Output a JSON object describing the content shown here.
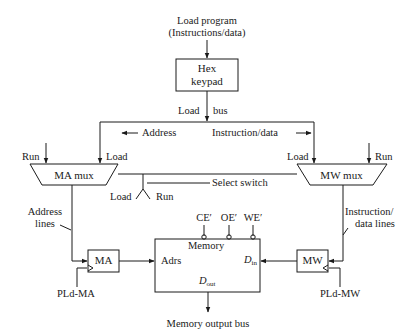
{
  "diagram": {
    "input": {
      "line1": "Load program",
      "line2": "(Instructions/data)"
    },
    "hex_keypad": {
      "line1": "Hex",
      "line2": "keypad"
    },
    "load_bus": {
      "left": "Load",
      "right": "bus"
    },
    "bus_labels": {
      "address": "Address",
      "instruction_data": "Instruction/data"
    },
    "ma_mux": {
      "label": "MA mux",
      "run": "Run",
      "load": "Load"
    },
    "mw_mux": {
      "label": "MW mux",
      "run": "Run",
      "load": "Load"
    },
    "select_switch": {
      "label": "Select switch",
      "load": "Load",
      "run": "Run"
    },
    "address_lines": {
      "line1": "Address",
      "line2": "lines"
    },
    "instruction_data_lines": {
      "line1": "Instruction/",
      "line2": "data lines"
    },
    "ma": {
      "label": "MA",
      "clock": "PLd-MA"
    },
    "mw": {
      "label": "MW",
      "clock": "PLd-MW"
    },
    "memory": {
      "title": "Memory",
      "adrs": "Adrs",
      "din": "D",
      "din_sub": "in",
      "dout": "D",
      "dout_sub": "out",
      "controls": [
        "CE′",
        "OE′",
        "WE′"
      ]
    },
    "output": "Memory output bus"
  }
}
